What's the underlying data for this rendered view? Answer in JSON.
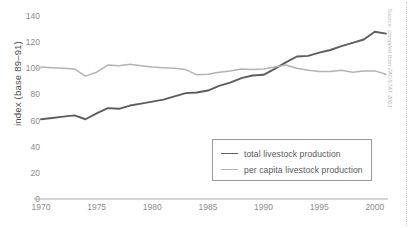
{
  "chart_data": {
    "type": "line",
    "title": "",
    "xlabel": "",
    "ylabel": "index (base 89–91)",
    "xlim": [
      1970,
      2001
    ],
    "ylim": [
      0,
      140
    ],
    "grid": false,
    "legend_position": "inside-lower-right",
    "xticks": [
      "1970",
      "1975",
      "1980",
      "1985",
      "1990",
      "1995",
      "2000"
    ],
    "xtick_values": [
      1970,
      1975,
      1980,
      1985,
      1990,
      1995,
      2000
    ],
    "yticks": [
      "0",
      "20",
      "40",
      "60",
      "80",
      "100",
      "120",
      "140"
    ],
    "ytick_values": [
      0,
      20,
      40,
      60,
      80,
      100,
      120,
      140
    ],
    "x": [
      1970,
      1971,
      1972,
      1973,
      1974,
      1975,
      1976,
      1977,
      1978,
      1979,
      1980,
      1981,
      1982,
      1983,
      1984,
      1985,
      1986,
      1987,
      1988,
      1989,
      1990,
      1991,
      1992,
      1993,
      1994,
      1995,
      1996,
      1997,
      1998,
      1999,
      2000,
      2001
    ],
    "series": [
      {
        "name": "total livestock production",
        "color": "#5d5d5d",
        "values": [
          61.0,
          62.0,
          63.0,
          64.0,
          61.0,
          65.5,
          69.5,
          69.0,
          71.5,
          73.0,
          74.5,
          76.0,
          78.5,
          81.0,
          81.5,
          83.0,
          86.5,
          89.0,
          92.5,
          94.5,
          95.0,
          99.5,
          104.5,
          109.0,
          109.5,
          112.0,
          114.0,
          117.0,
          119.5,
          122.0,
          128.0,
          126.5
        ]
      },
      {
        "name": "per capita livestock production",
        "color": "#b3b3b3",
        "values": [
          101.0,
          100.5,
          100.0,
          99.5,
          94.0,
          97.0,
          102.5,
          102.0,
          103.0,
          102.0,
          101.0,
          100.5,
          100.0,
          99.0,
          95.0,
          95.5,
          97.0,
          98.0,
          99.5,
          99.0,
          99.5,
          101.0,
          102.5,
          100.0,
          98.5,
          97.5,
          97.5,
          98.5,
          97.0,
          98.0,
          98.0,
          95.5
        ]
      }
    ],
    "annotations": {
      "source": "Source: compiled from FAOSTAT 2001"
    }
  },
  "legend": {
    "entries": [
      {
        "label": "total livestock production"
      },
      {
        "label": "per capita livestock production"
      }
    ]
  }
}
